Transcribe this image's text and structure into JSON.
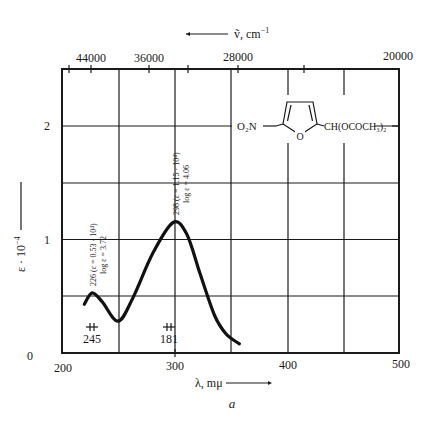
{
  "chart_data": {
    "type": "line",
    "title": "",
    "panel_label": "a",
    "xlabel": "λ, mμ",
    "ylabel": "ε · 10⁻⁴",
    "top_axis_label": "ṽ, cm⁻¹",
    "xlim": [
      200,
      500
    ],
    "ylim": [
      0,
      2.5
    ],
    "x_ticks": [
      200,
      300,
      400,
      500
    ],
    "y_ticks": [
      0,
      1,
      2
    ],
    "top_axis_ticks": [
      "44000",
      "36000",
      "28000",
      "20000"
    ],
    "grid": true,
    "series": [
      {
        "name": "absorption",
        "x": [
          219,
          226,
          235,
          249,
          262,
          280,
          298,
          310,
          322,
          335,
          345,
          357
        ],
        "y": [
          0.43,
          0.53,
          0.45,
          0.28,
          0.48,
          0.88,
          1.15,
          1.05,
          0.7,
          0.33,
          0.17,
          0.08
        ]
      }
    ],
    "annotations": [
      {
        "text": "226 (ε = 0.53 · 10⁴)",
        "text2": "log ε = 3.72",
        "x": 226,
        "y": 0.53
      },
      {
        "text": "298 (ε = 1.15 · 10⁴)",
        "text2": "log ε = 4.06",
        "x": 298,
        "y": 1.15
      },
      {
        "text": "245",
        "note": "slit width marker",
        "x": 226
      },
      {
        "text": "181",
        "note": "slit width marker",
        "x": 298
      }
    ],
    "structure_label": {
      "left": "O₂N",
      "ring_atom": "O",
      "right": "CH(OCOCH₃)₂"
    }
  },
  "labels": {
    "top_axis": "ṽ, cm",
    "top_axis_sup": "−1",
    "top_ticks": [
      "44000",
      "36000",
      "28000",
      "20000"
    ],
    "y_ticks": [
      "0",
      "1",
      "2"
    ],
    "x_ticks": [
      "200",
      "300",
      "400",
      "500"
    ],
    "ylabel_main": "ε · 10",
    "ylabel_sup": "−4",
    "xlabel": "λ, mμ",
    "panel": "a",
    "peak1_line1": "226 (ε = 0.53 · 10⁴)",
    "peak1_line2": "log ε = 3.72",
    "peak2_line1": "298 (ε = 1.15 · 10⁴)",
    "peak2_line2": "log ε = 4.06",
    "slit1": "245",
    "slit2": "181",
    "struct_left": "O₂N",
    "struct_o": "O",
    "struct_right": "CH(OCOCH₃)₂"
  }
}
